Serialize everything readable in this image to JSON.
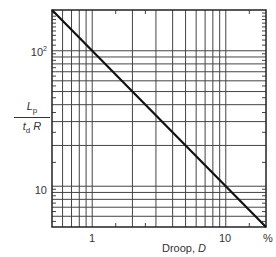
{
  "chart_data": {
    "type": "line",
    "title": "",
    "xlabel": "Droop, D",
    "xunit": "%",
    "ylabel": "Lp / (td R)",
    "xscale": "log",
    "yscale": "log",
    "xlim": [
      0.5,
      20
    ],
    "ylim": [
      5,
      200
    ],
    "xticks": [
      {
        "value": 1,
        "label": "1"
      },
      {
        "value": 10,
        "label": "10"
      }
    ],
    "yticks": [
      {
        "value": 10,
        "label": "10"
      },
      {
        "value": 100,
        "label": "10²"
      }
    ],
    "grid": true,
    "legend": null,
    "series": [
      {
        "name": "Lp/(td R) vs Droop",
        "relation": "Lp/(td R) = 100 / D",
        "x": [
          0.5,
          1,
          2,
          5,
          10,
          20
        ],
        "y": [
          200,
          100,
          50,
          20,
          10,
          5
        ]
      }
    ]
  },
  "labels": {
    "x_tick_1": "1",
    "x_tick_10": "10",
    "x_unit": "%",
    "x_axis": "Droop, ",
    "x_axis_var": "D",
    "y_tick_10": "10",
    "y_tick_100_base": "10",
    "y_tick_100_exp": "2",
    "y_num_main": "L",
    "y_num_sub": "p",
    "y_den_main": "t",
    "y_den_sub": "d",
    "y_den_tail": " R"
  }
}
